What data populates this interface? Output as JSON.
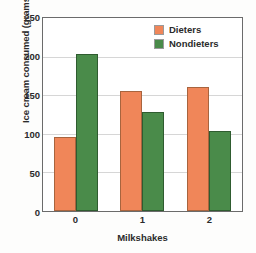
{
  "chart_data": {
    "type": "bar",
    "title": "",
    "xlabel": "Milkshakes",
    "ylabel": "Ice cream consumed (grams)",
    "categories": [
      "0",
      "1",
      "2"
    ],
    "series": [
      {
        "name": "Dieters",
        "color": "#f08659",
        "values": [
          96,
          155,
          161
        ]
      },
      {
        "name": "Nondieters",
        "color": "#4a8b4a",
        "values": [
          204,
          128,
          104
        ]
      }
    ],
    "ylim": [
      0,
      250
    ],
    "yticks": [
      0,
      50,
      100,
      150,
      200,
      250
    ],
    "ytick_labels": [
      "0",
      "50",
      "100",
      "150",
      "200",
      "250"
    ],
    "grid": true,
    "legend_position": "top-right"
  }
}
